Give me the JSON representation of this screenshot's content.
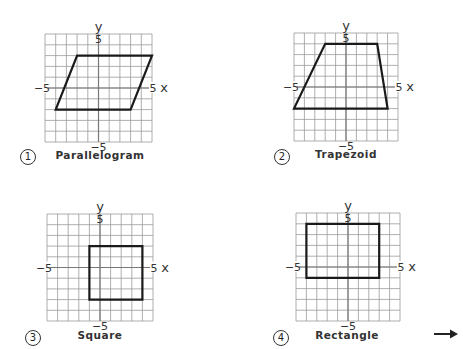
{
  "figure": {
    "grid_range": [
      -5,
      5
    ],
    "axis_labels": {
      "x": "x",
      "y": "y"
    },
    "tick_labels": {
      "pos": "5",
      "neg": "−5"
    },
    "grid_color": "#9a9a9a",
    "axis_color": "#777777",
    "shape_color": "#1a1a1a"
  },
  "panels": [
    {
      "number": "1",
      "caption": "Parallelogram",
      "vertices": [
        [
          -2,
          3
        ],
        [
          5,
          3
        ],
        [
          3,
          -2
        ],
        [
          -4,
          -2
        ]
      ],
      "grid_box": [
        45,
        34,
        107,
        108
      ],
      "num_pos": [
        20,
        149
      ],
      "caption_pos": [
        100,
        149
      ]
    },
    {
      "number": "2",
      "caption": "Trapezoid",
      "vertices": [
        [
          -2,
          4
        ],
        [
          3,
          4
        ],
        [
          4,
          -2
        ],
        [
          -5,
          -2
        ]
      ],
      "grid_box": [
        294,
        33,
        104,
        108
      ],
      "num_pos": [
        274,
        149
      ],
      "caption_pos": [
        346,
        148
      ]
    },
    {
      "number": "3",
      "caption": "Square",
      "vertices": [
        [
          -1,
          2
        ],
        [
          4,
          2
        ],
        [
          4,
          -3
        ],
        [
          -1,
          -3
        ]
      ],
      "grid_box": [
        47,
        214,
        106,
        107
      ],
      "num_pos": [
        25,
        330
      ],
      "caption_pos": [
        100,
        329
      ]
    },
    {
      "number": "4",
      "caption": "Rectangle",
      "vertices": [
        [
          -4,
          4
        ],
        [
          3,
          4
        ],
        [
          3,
          -1
        ],
        [
          -4,
          -1
        ]
      ],
      "grid_box": [
        296,
        213,
        104,
        108
      ],
      "num_pos": [
        273,
        330
      ],
      "caption_pos": [
        347,
        329
      ]
    }
  ],
  "continue_arrow": "right-arrow"
}
